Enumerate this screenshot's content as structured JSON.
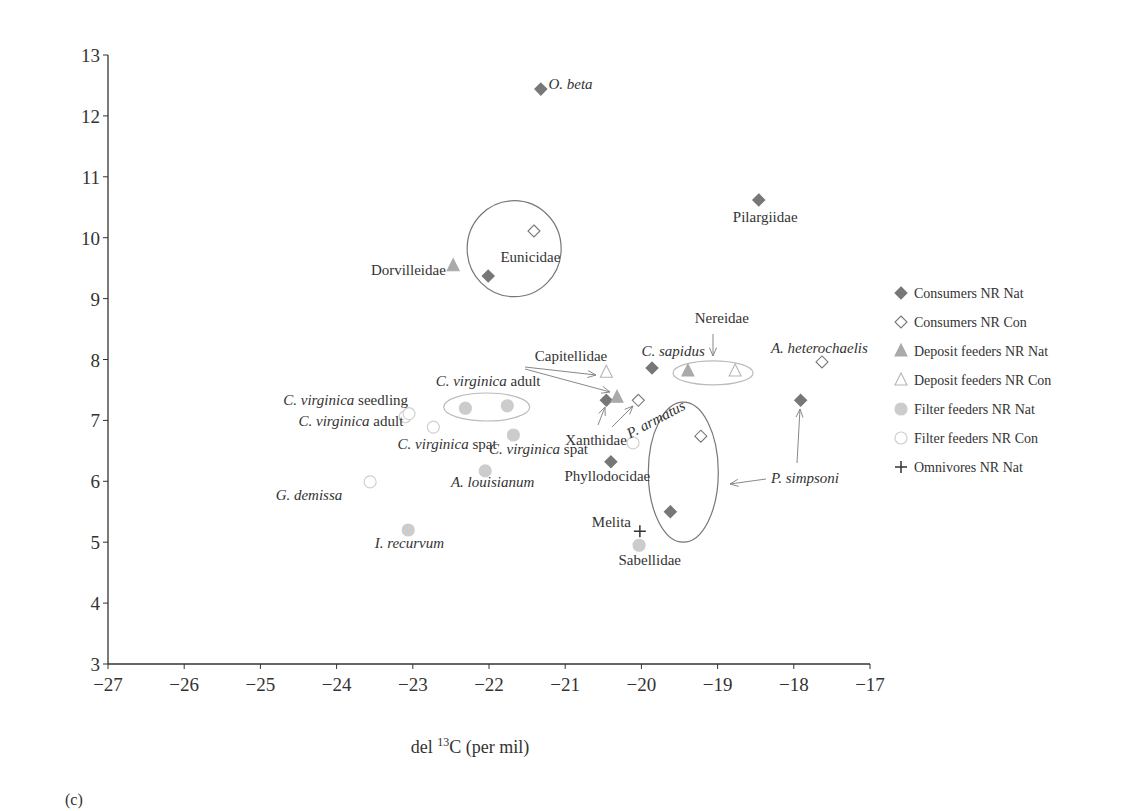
{
  "chart_data": {
    "type": "scatter",
    "title": "",
    "panel_label": "(c)",
    "xlabel_prefix": "del ",
    "xlabel_sup": "13",
    "xlabel_suffix": "C (per mil)",
    "ylabel": "",
    "xlim": [
      -27,
      -17
    ],
    "ylim": [
      3,
      13
    ],
    "xticks": [
      -27,
      -26,
      -25,
      -24,
      -23,
      -22,
      -21,
      -20,
      -19,
      -18,
      -17
    ],
    "yticks": [
      3,
      4,
      5,
      6,
      7,
      8,
      9,
      10,
      11,
      12,
      13
    ],
    "xtick_labels": [
      "−27",
      "−26",
      "−25",
      "−24",
      "−23",
      "−22",
      "−21",
      "−20",
      "−19",
      "−18",
      "−17"
    ],
    "grid": false,
    "legend_position": "right",
    "series": [
      {
        "name": "Consumers NR Nat",
        "marker": "diamond-filled",
        "color": "#777777",
        "points": [
          [
            -21.32,
            12.44
          ],
          [
            -18.46,
            10.62
          ],
          [
            -22.01,
            9.37
          ],
          [
            -20.46,
            7.33
          ],
          [
            -19.86,
            7.86
          ],
          [
            -17.91,
            7.33
          ],
          [
            -20.4,
            6.32
          ],
          [
            -19.62,
            5.5
          ]
        ]
      },
      {
        "name": "Consumers NR Con",
        "marker": "diamond-open",
        "color": "#777777",
        "points": [
          [
            -21.41,
            10.11
          ],
          [
            -20.04,
            7.33
          ],
          [
            -17.63,
            7.96
          ],
          [
            -19.22,
            6.74
          ]
        ]
      },
      {
        "name": "Deposit feeders NR Nat",
        "marker": "triangle-filled",
        "color": "#aaaaaa",
        "points": [
          [
            -22.47,
            9.54
          ],
          [
            -20.32,
            7.38
          ],
          [
            -19.39,
            7.81
          ]
        ]
      },
      {
        "name": "Deposit feeders NR Con",
        "marker": "triangle-open",
        "color": "#aaaaaa",
        "points": [
          [
            -20.46,
            7.79
          ],
          [
            -18.77,
            7.81
          ]
        ]
      },
      {
        "name": "Filter feeders NR Nat",
        "marker": "circle-filled",
        "color": "#cccccc",
        "points": [
          [
            -22.31,
            7.2
          ],
          [
            -21.76,
            7.24
          ],
          [
            -21.68,
            6.76
          ],
          [
            -22.05,
            6.17
          ],
          [
            -23.06,
            5.2
          ],
          [
            -20.03,
            4.95
          ]
        ]
      },
      {
        "name": "Filter feeders NR Con",
        "marker": "circle-open",
        "color": "#cccccc",
        "points": [
          [
            -23.1,
            7.06
          ],
          [
            -23.05,
            7.11
          ],
          [
            -22.73,
            6.89
          ],
          [
            -23.56,
            5.99
          ],
          [
            -20.11,
            6.63
          ]
        ]
      },
      {
        "name": "Omnivores NR Nat",
        "marker": "plus",
        "color": "#333333",
        "points": [
          [
            -20.02,
            5.18
          ]
        ]
      }
    ],
    "annotations": [
      {
        "text": "O. beta",
        "italic": true,
        "x": -21.22,
        "y": 12.44
      },
      {
        "text": "Pilargiidae",
        "italic": false,
        "x": -18.8,
        "y": 10.25
      },
      {
        "text": "Eunicidae",
        "italic": false,
        "x": -21.85,
        "y": 9.6
      },
      {
        "text": "Dorvilleidae",
        "italic": false,
        "x": -23.55,
        "y": 9.38
      },
      {
        "text": "Nereidae",
        "italic": false,
        "x": -19.3,
        "y": 8.6
      },
      {
        "text": "Capitellidae",
        "italic": false,
        "x": -21.4,
        "y": 7.98
      },
      {
        "text": "A. heterochaelis",
        "italic": true,
        "x": -18.3,
        "y": 8.11
      },
      {
        "text": "Xanthidae",
        "italic": false,
        "x": -21.0,
        "y": 6.6
      },
      {
        "text": "Phyllodocidae",
        "italic": false,
        "x": -21.01,
        "y": 6.0
      },
      {
        "text": "Melita",
        "italic": false,
        "x": -20.65,
        "y": 5.25
      },
      {
        "text": "Sabellidae",
        "italic": false,
        "x": -20.3,
        "y": 4.63
      },
      {
        "text": "P. simpsoni",
        "italic": true,
        "x": -18.3,
        "y": 5.97
      },
      {
        "text": "I. recurvum",
        "italic": true,
        "x": -23.5,
        "y": 4.9
      },
      {
        "text": "G. demissa",
        "italic": true,
        "x": -24.8,
        "y": 5.7
      },
      {
        "text": "A. louisianum",
        "italic": true,
        "x": -22.5,
        "y": 5.9
      }
    ],
    "styled_labels": [
      {
        "italic": "C. sapidus",
        "plain": "",
        "x": -20.0,
        "y": 8.06
      },
      {
        "italic": "C. virginica",
        "plain": " adult",
        "x": -22.7,
        "y": 7.57
      },
      {
        "italic": "C. virginica",
        "plain": " seedling",
        "x": -24.7,
        "y": 7.25
      },
      {
        "italic": "C. virginica",
        "plain": " adult",
        "x": -24.5,
        "y": 6.9
      },
      {
        "italic": "C. virginica",
        "plain": " spat",
        "x": -23.2,
        "y": 6.53
      },
      {
        "italic": "C. virginica",
        "plain": " spat",
        "x": -22.0,
        "y": 6.45
      }
    ],
    "rotated_label": {
      "text": "P. armatus",
      "x": -20.15,
      "y": 6.7,
      "angle": -28
    }
  }
}
